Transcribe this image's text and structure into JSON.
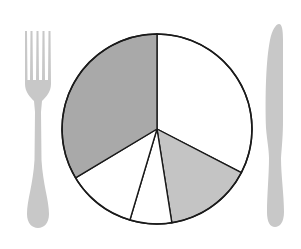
{
  "chart_data": {
    "type": "pie",
    "title": "",
    "categories": [
      "Slice A (white, top-right)",
      "Slice B (light gray)",
      "Slice C (white, small)",
      "Slice D (white, lower-left)",
      "Slice E (dark gray)"
    ],
    "values": [
      32.6,
      14.9,
      7.1,
      11.8,
      33.6
    ],
    "units": "percent (estimated from angles)",
    "start_angle_deg": -90,
    "direction": "clockwise",
    "colors": [
      "#ffffff",
      "#c4c4c4",
      "#ffffff",
      "#ffffff",
      "#a9a9a9"
    ],
    "stroke_color": "#1a1a1a",
    "legend": null,
    "labels_shown": false,
    "decoration": "pie drawn as a dinner plate flanked by a fork (left) and a knife (right)"
  },
  "scene": {
    "background": "#ffffff",
    "cutlery_color": "#c8c8c8",
    "center": [
      157,
      129
    ],
    "radius": 95
  }
}
